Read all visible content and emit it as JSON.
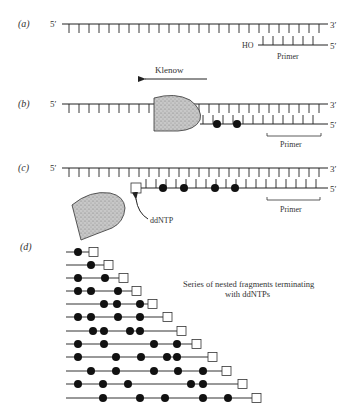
{
  "panels": {
    "a": {
      "label": "(a)",
      "top_5": "5′",
      "top_3": "3′",
      "primer_ho": "HO",
      "primer_5": "5′",
      "primer_label": "Primer",
      "enzyme_label": "Klenow"
    },
    "b": {
      "label": "(b)",
      "top_5": "5′",
      "top_3": "3′",
      "bottom_5": "5′",
      "primer_label": "Primer"
    },
    "c": {
      "label": "(c)",
      "top_5": "5′",
      "top_3": "3′",
      "bottom_5": "5′",
      "primer_label": "Primer",
      "ddntp_label": "ddNTP"
    },
    "d": {
      "label": "(d)",
      "caption_line1": "Series of nested fragments terminating",
      "caption_line2": "with ddNTPs",
      "fragments": [
        {
          "dots": [
            78
          ],
          "square_x": 89
        },
        {
          "dots": [
            91
          ],
          "square_x": 104
        },
        {
          "dots": [
            78,
            105
          ],
          "square_x": 119
        },
        {
          "dots": [
            78,
            91,
            118
          ],
          "square_x": 132
        },
        {
          "dots": [
            104,
            117,
            140
          ],
          "square_x": 148
        },
        {
          "dots": [
            78,
            91,
            118,
            140
          ],
          "square_x": 163
        },
        {
          "dots": [
            93,
            104,
            130,
            140
          ],
          "square_x": 177
        },
        {
          "dots": [
            78,
            104,
            154,
            177
          ],
          "square_x": 192
        },
        {
          "dots": [
            78,
            116,
            141,
            167,
            177
          ],
          "square_x": 208
        },
        {
          "dots": [
            91,
            116,
            154,
            178,
            203
          ],
          "square_x": 222
        },
        {
          "dots": [
            78,
            103,
            128,
            191,
            203
          ],
          "square_x": 238
        },
        {
          "dots": [
            103,
            140,
            165,
            203,
            228
          ],
          "square_x": 252
        }
      ]
    }
  },
  "colors": {
    "ink": "#222222",
    "enzyme_fill": "#bdbdbd"
  }
}
